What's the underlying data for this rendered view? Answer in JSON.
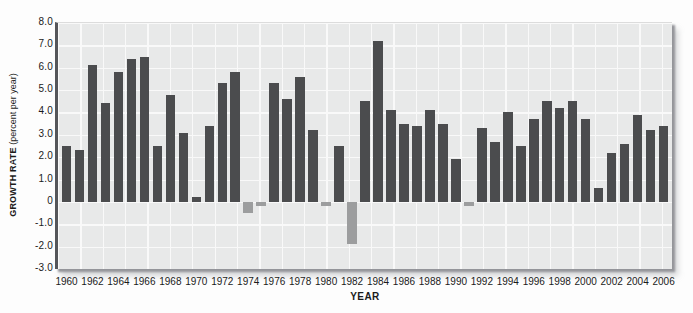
{
  "chart_data": {
    "type": "bar",
    "title": "",
    "xlabel": "YEAR",
    "ylabel": "GROWTH RATE (percent per year)",
    "ylabel_bold_part": "GROWTH RATE",
    "ylabel_regular_part": " (percent per year)",
    "ylim": [
      -3.0,
      8.0
    ],
    "ytick_step": 1.0,
    "ytick_labels": [
      "8.0",
      "7.0",
      "6.0",
      "5.0",
      "4.0",
      "3.0",
      "2.0",
      "1.0",
      "0",
      "-1.0",
      "-2.0",
      "-3.0"
    ],
    "xtick_labels": [
      "1960",
      "1962",
      "1964",
      "1966",
      "1968",
      "1970",
      "1972",
      "1974",
      "1976",
      "1978",
      "1980",
      "1982",
      "1984",
      "1986",
      "1988",
      "1990",
      "1992",
      "1994",
      "1996",
      "1998",
      "2000",
      "2002",
      "2004",
      "2006"
    ],
    "categories": [
      1960,
      1961,
      1962,
      1963,
      1964,
      1965,
      1966,
      1967,
      1968,
      1969,
      1970,
      1971,
      1972,
      1973,
      1974,
      1975,
      1976,
      1977,
      1978,
      1979,
      1980,
      1981,
      1982,
      1983,
      1984,
      1985,
      1986,
      1987,
      1988,
      1989,
      1990,
      1991,
      1992,
      1993,
      1994,
      1995,
      1996,
      1997,
      1998,
      1999,
      2000,
      2001,
      2002,
      2003,
      2004,
      2005,
      2006
    ],
    "values": [
      2.5,
      2.3,
      6.1,
      4.4,
      5.8,
      6.4,
      6.5,
      2.5,
      4.8,
      3.1,
      0.2,
      3.4,
      5.3,
      5.8,
      -0.5,
      -0.2,
      5.3,
      4.6,
      5.6,
      3.2,
      -0.2,
      2.5,
      -1.9,
      4.5,
      7.2,
      4.1,
      3.5,
      3.4,
      4.1,
      3.5,
      1.9,
      -0.2,
      3.3,
      2.7,
      4.0,
      2.5,
      3.7,
      4.5,
      4.2,
      4.5,
      3.7,
      0.6,
      2.2,
      2.6,
      3.9,
      3.2,
      3.4
    ],
    "grid": true,
    "legend_position": "none",
    "colors": {
      "bar_positive": "#4b4c4e",
      "bar_negative": "#9c9d9e",
      "plot_background": "#e8e9e9",
      "gridline": "#f9f9f9",
      "axis_line": "#55565a",
      "text": "#1b1b1b",
      "shadow": "#94959a"
    }
  }
}
